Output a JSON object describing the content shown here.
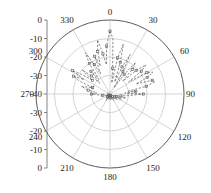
{
  "chart_data": {
    "type": "line",
    "subtype": "polar-radiation-pattern",
    "title": "",
    "xlabel": "",
    "ylabel": "",
    "grid": true,
    "legend": null,
    "center": {
      "x": 110,
      "y": 94
    },
    "radius": 74,
    "radial_axis": {
      "unit": "dB",
      "min": -40,
      "max": 0,
      "ring_values": [
        0,
        -10,
        -20,
        -30,
        -40
      ],
      "ring_radii_px": [
        74,
        55.5,
        37,
        18.5,
        0
      ]
    },
    "vertical_axis": {
      "labels": [
        "0",
        "-10",
        "-20",
        "-30",
        "-40",
        "-30",
        "-20",
        "-10",
        "0"
      ],
      "values": [
        0,
        -10,
        -20,
        -30,
        -40,
        -30,
        -20,
        -10,
        0
      ],
      "y_px": [
        20,
        38.5,
        57,
        75.5,
        94,
        112.5,
        131,
        149.5,
        168
      ]
    },
    "angular_axis": {
      "labels": [
        "0",
        "30",
        "60",
        "90",
        "120",
        "150",
        "180",
        "210",
        "240",
        "270",
        "300",
        "330"
      ],
      "values": [
        0,
        30,
        60,
        90,
        120,
        150,
        180,
        210,
        240,
        270,
        300,
        330
      ],
      "step": 30,
      "zero_at": "top",
      "direction": "clockwise"
    },
    "series": [
      {
        "name": "measured-pattern",
        "style": "dashed",
        "marker": "square",
        "color": "#555555",
        "theta": [
          0,
          3,
          6,
          9,
          12,
          15,
          18,
          21,
          24,
          27,
          30,
          33,
          36,
          39,
          42,
          45,
          48,
          51,
          54,
          57,
          60,
          63,
          66,
          69,
          72,
          75,
          78,
          81,
          84,
          87,
          90,
          95,
          100,
          105,
          110,
          115,
          120,
          130,
          140,
          150,
          160,
          170,
          180,
          190,
          200,
          210,
          220,
          230,
          240,
          250,
          260,
          265,
          270,
          275,
          280,
          285,
          290,
          293,
          296,
          299,
          302,
          305,
          308,
          311,
          314,
          317,
          320,
          323,
          326,
          329,
          332,
          335,
          338,
          341,
          344,
          347,
          350,
          353,
          356,
          359
        ],
        "r_db": [
          -6,
          -10,
          -26,
          -34,
          -20,
          -12,
          -22,
          -33,
          -24,
          -16,
          -26,
          -36,
          -27,
          -18,
          -22,
          -30,
          -21,
          -15,
          -19,
          -28,
          -17,
          -14,
          -18,
          -25,
          -16,
          -15,
          -20,
          -30,
          -26,
          -32,
          -22,
          -30,
          -34,
          -31,
          -36,
          -33,
          -37,
          -35,
          -38,
          -36,
          -39,
          -37,
          -38,
          -37,
          -39,
          -36,
          -38,
          -37,
          -39,
          -38,
          -36,
          -34,
          -30,
          -33,
          -28,
          -24,
          -30,
          -22,
          -18,
          -24,
          -16,
          -22,
          -28,
          -20,
          -26,
          -32,
          -24,
          -30,
          -20,
          -14,
          -22,
          -28,
          -18,
          -24,
          -16,
          -10,
          -18,
          -24,
          -14,
          -8
        ]
      }
    ]
  },
  "figure": {
    "background": "#ffffff",
    "grid_color": "#b9b9b9",
    "axis_color": "#666666",
    "trace_color": "#555555"
  }
}
